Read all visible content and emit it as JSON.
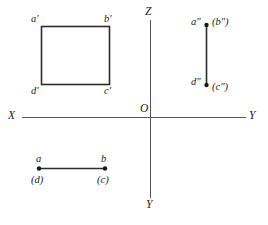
{
  "figure": {
    "stroke_color": "#2b2b2b",
    "text_color": "#1a1a1a",
    "axis_color": "#555555",
    "background": "#ffffff"
  },
  "axes": {
    "x_label": "X",
    "y_right_label": "Y",
    "y_bottom_label": "Y",
    "z_label": "Z",
    "origin_label": "O"
  },
  "front_view": {
    "name": "front-view-square",
    "corner_top_left": "a'",
    "corner_top_right": "b'",
    "corner_bottom_left": "d'",
    "corner_bottom_right": "c'"
  },
  "side_view": {
    "name": "side-view-line",
    "top_visible": "a″",
    "top_hidden": "(b″)",
    "bottom_visible": "d″",
    "bottom_hidden": "(c″)"
  },
  "top_view": {
    "name": "top-view-line",
    "left_visible": "a",
    "left_hidden": "(d)",
    "right_visible": "b",
    "right_hidden": "(c)"
  }
}
